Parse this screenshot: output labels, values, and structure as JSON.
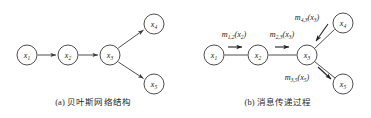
{
  "figure": {
    "panels": [
      {
        "id": "a",
        "caption": "(a) 贝叶斯网络结构",
        "caption_tag": "(a)",
        "caption_text": "贝叶斯网络结构",
        "graph_type": "directed",
        "nodes": [
          {
            "id": "x1",
            "label": "x",
            "subscript": "1",
            "cx": 27,
            "cy": 55
          },
          {
            "id": "x2",
            "label": "x",
            "subscript": "2",
            "cx": 68,
            "cy": 55
          },
          {
            "id": "x3",
            "label": "x",
            "subscript": "3",
            "cx": 110,
            "cy": 55
          },
          {
            "id": "x4",
            "label": "x",
            "subscript": "4",
            "cx": 154,
            "cy": 24
          },
          {
            "id": "x5",
            "label": "x",
            "subscript": "5",
            "cx": 154,
            "cy": 84
          }
        ],
        "edges": [
          {
            "from": "x1",
            "to": "x2",
            "arrow": true
          },
          {
            "from": "x2",
            "to": "x3",
            "arrow": true
          },
          {
            "from": "x3",
            "to": "x4",
            "arrow": true
          },
          {
            "from": "x3",
            "to": "x5",
            "arrow": true
          }
        ]
      },
      {
        "id": "b",
        "caption": "(b) 消息传递过程",
        "caption_tag": "(b)",
        "caption_text": "消息传递过程",
        "graph_type": "undirected-with-messages",
        "nodes": [
          {
            "id": "x1",
            "label": "x",
            "subscript": "1",
            "cx": 29,
            "cy": 55
          },
          {
            "id": "x2",
            "label": "x",
            "subscript": "2",
            "cx": 73,
            "cy": 55
          },
          {
            "id": "x3",
            "label": "x",
            "subscript": "3",
            "cx": 122,
            "cy": 55
          },
          {
            "id": "x4",
            "label": "x",
            "subscript": "4",
            "cx": 158,
            "cy": 23
          },
          {
            "id": "x5",
            "label": "x",
            "subscript": "5",
            "cx": 158,
            "cy": 84
          }
        ],
        "edges": [
          {
            "from": "x1",
            "to": "x2",
            "arrow": false
          },
          {
            "from": "x2",
            "to": "x3",
            "arrow": false
          },
          {
            "from": "x3",
            "to": "x4",
            "arrow": false
          },
          {
            "from": "x3",
            "to": "x5",
            "arrow": false
          }
        ],
        "messages": [
          {
            "id": "m12",
            "symbol": "m",
            "sub": "1,2",
            "arg": "(x",
            "arg_sub": "2",
            "arg_close": ")",
            "text": "m1,2(x2)",
            "label_x": 49,
            "label_y": 36,
            "arrow": {
              "x1": 40,
              "y1": 48,
              "x2": 57,
              "y2": 48
            }
          },
          {
            "id": "m23",
            "symbol": "m",
            "sub": "2,3",
            "arg": "(x",
            "arg_sub": "3",
            "arg_close": ")",
            "text": "m2,3(x3)",
            "label_x": 97,
            "label_y": 36,
            "arrow": {
              "x1": 88,
              "y1": 48,
              "x2": 105,
              "y2": 48
            }
          },
          {
            "id": "m43",
            "symbol": "m",
            "sub": "4,3",
            "arg": "(x",
            "arg_sub": "3",
            "arg_close": ")",
            "text": "m4,3(x3)",
            "label_x": 122,
            "label_y": 19,
            "arrow": {
              "x1": 141,
              "y1": 26,
              "x2": 130,
              "y2": 40
            }
          },
          {
            "id": "m35",
            "symbol": "m",
            "sub": "3,5",
            "arg": "(x",
            "arg_sub": "5",
            "arg_close": ")",
            "text": "m3,5(x5)",
            "label_x": 113,
            "label_y": 79,
            "arrow": {
              "x1": 131,
              "y1": 68,
              "x2": 144,
              "y2": 80
            }
          }
        ]
      }
    ],
    "style": {
      "node_radius": 10,
      "stroke": "#3a3a3a",
      "node_fill": "#ffffff",
      "text_color": "#1a1a1a",
      "background": "#ffffff"
    }
  }
}
